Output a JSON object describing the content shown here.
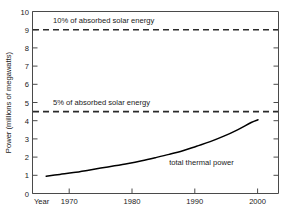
{
  "chart_data": {
    "type": "line",
    "title": "",
    "subtitle": "",
    "xlabel": "Year",
    "ylabel": "Power (millions of megawatts)",
    "xlim": [
      1967,
      2003
    ],
    "ylim": [
      0,
      10
    ],
    "xticks": [
      1970,
      1980,
      1990,
      2000
    ],
    "xtick_labels": [
      "1970",
      "1980",
      "1990",
      "2000"
    ],
    "yticks": [
      0,
      1,
      2,
      3,
      4,
      5,
      6,
      7,
      8,
      9,
      10
    ],
    "ytick_labels": [
      "0",
      "1",
      "2",
      "3",
      "4",
      "5",
      "6",
      "7",
      "8",
      "9",
      "10"
    ],
    "grid": false,
    "legend_position": "inline-annotation",
    "series": [
      {
        "name": "total thermal power",
        "label": "total thermal power",
        "style": "solid",
        "color": "#000000",
        "x": [
          1969,
          1971,
          1973,
          1975,
          1977,
          1979,
          1981,
          1983,
          1985,
          1987,
          1989,
          1991,
          1993,
          1995,
          1997,
          1999,
          2000
        ],
        "values": [
          0.95,
          1.05,
          1.15,
          1.27,
          1.4,
          1.52,
          1.65,
          1.8,
          1.97,
          2.15,
          2.35,
          2.6,
          2.85,
          3.15,
          3.5,
          3.9,
          4.05
        ]
      }
    ],
    "reference_lines": [
      {
        "name": "ten-percent-absorbed-solar",
        "label": "10% of absorbed solar energy",
        "y": 9.0,
        "style": "dashed",
        "color": "#2b2b2b"
      },
      {
        "name": "five-percent-absorbed-solar",
        "label": "5% of absorbed solar energy",
        "y": 4.5,
        "style": "dashed",
        "color": "#2b2b2b"
      }
    ],
    "annotations": [
      {
        "text": "10% of absorbed solar energy",
        "x": 1970,
        "y": 9.35
      },
      {
        "text": "5% of absorbed solar energy",
        "x": 1970,
        "y": 4.85
      },
      {
        "text": "total thermal power",
        "x": 1987,
        "y": 1.55
      }
    ]
  },
  "axes": {
    "y_title": "Power (millions of megawatts)",
    "x_title": "Year",
    "y_labels": {
      "v10": "10",
      "v9": "9",
      "v8": "8",
      "v7": "7",
      "v6": "6",
      "v5": "5",
      "v4": "4",
      "v3": "3",
      "v2": "2",
      "v1": "1",
      "v0": "0"
    },
    "x_labels": {
      "t1970": "1970",
      "t1980": "1980",
      "t1990": "1990",
      "t2000": "2000"
    }
  },
  "labels": {
    "ref_10": "10% of absorbed solar energy",
    "ref_5": "5% of absorbed solar energy",
    "series_1": "total thermal power"
  },
  "colors": {
    "curve": "#000000",
    "reference": "#2b2b2b",
    "frame": "#4a4a4a",
    "text": "#1a1a1a",
    "background": "#ffffff"
  }
}
